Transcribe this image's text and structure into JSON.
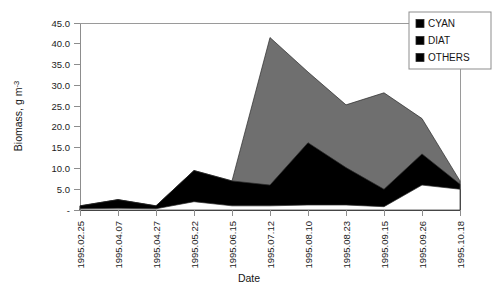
{
  "chart_data": {
    "type": "area",
    "stacked": true,
    "title": "",
    "xlabel": "Date",
    "ylabel": "Biomass, g m-3",
    "ylabel_display": "Biomass, g m",
    "ylabel_exponent": "-3",
    "categories": [
      "1995.02.25",
      "1995.04.07",
      "1995.04.27",
      "1995.05.22",
      "1995.06.15",
      "1995.07.12",
      "1995.08.10",
      "1995.08.23",
      "1995.09.15",
      "1995.09.26",
      "1995.10.18"
    ],
    "series": [
      {
        "name": "OTHERS",
        "color": "#ffffff",
        "stack_order": 1,
        "values": [
          0.3,
          0.4,
          0.3,
          2.0,
          1.0,
          1.0,
          1.2,
          1.2,
          0.8,
          6.0,
          5.0
        ]
      },
      {
        "name": "DIAT",
        "color": "#000000",
        "stack_order": 2,
        "values": [
          0.7,
          2.1,
          0.7,
          7.5,
          6.0,
          5.0,
          15.0,
          9.0,
          4.2,
          7.5,
          1.2
        ]
      },
      {
        "name": "CYAN",
        "color": "#6f6f6f",
        "stack_order": 3,
        "values": [
          0.0,
          0.0,
          0.0,
          0.0,
          0.0,
          35.5,
          17.0,
          15.1,
          23.2,
          8.5,
          0.8
        ]
      }
    ],
    "totals": [
      1.0,
      2.5,
      1.0,
      9.5,
      7.0,
      41.5,
      33.2,
      25.3,
      28.2,
      22.0,
      7.0
    ],
    "y_ticks": [
      "-",
      "5.0",
      "10.0",
      "15.0",
      "20.0",
      "25.0",
      "30.0",
      "35.0",
      "40.0",
      "45.0"
    ],
    "y_tick_values": [
      0,
      5,
      10,
      15,
      20,
      25,
      30,
      35,
      40,
      45
    ],
    "ylim": [
      0,
      45
    ],
    "grid": false,
    "legend_position": "top-right",
    "legend_entries": [
      {
        "label": "CYAN",
        "color": "#6f6f6f"
      },
      {
        "label": "DIAT",
        "color": "#000000"
      },
      {
        "label": "OTHERS",
        "color": "#ffffff"
      }
    ]
  }
}
